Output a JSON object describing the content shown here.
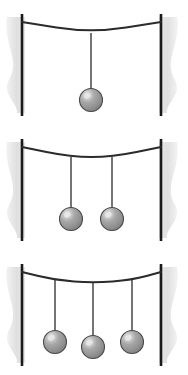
{
  "figure": {
    "width": 188,
    "height": 375,
    "background_color": "#ffffff",
    "panel_count": 3
  },
  "colors": {
    "background": "#ffffff",
    "post": "#1a1a1a",
    "post_shadow": "#dedede",
    "cable": "#2b2b2b",
    "string": "#3a3a3a",
    "ball_fill": "#9a9a9a",
    "ball_fill_dark": "#808080",
    "ball_highlight": "#e8e8e8",
    "ball_outline": "#4a4a4a"
  },
  "geometry": {
    "post_width": 2.6,
    "cable_width": 2.2,
    "string_width": 1.4,
    "ball_radius": 11.5,
    "left_post_x": 22,
    "right_post_x": 161
  },
  "panels": [
    {
      "id": "panel-one-mass",
      "name": "single-mass-panel",
      "mass_count": 1,
      "post_top_y": 14,
      "post_bottom_y": 116,
      "cable_anchor_left": {
        "x": 22,
        "y": 22
      },
      "cable_anchor_right": {
        "x": 161,
        "y": 22
      },
      "cable_vertices": [
        {
          "x": 22,
          "y": 22
        },
        {
          "x": 91,
          "y": 33
        },
        {
          "x": 161,
          "y": 22
        }
      ],
      "shadow_left": {
        "cx": 16,
        "cy": 65,
        "rx": 9,
        "ry": 48
      },
      "shadow_right": {
        "cx": 168,
        "cy": 65,
        "rx": 9,
        "ry": 48
      },
      "masses": [
        {
          "label": "mass-1",
          "anchor_x": 91,
          "anchor_y": 33,
          "ball_cx": 91,
          "ball_cy": 100,
          "string_length": 56
        }
      ]
    },
    {
      "id": "panel-two-masses",
      "name": "double-mass-panel",
      "mass_count": 2,
      "post_top_y": 139,
      "post_bottom_y": 241,
      "cable_anchor_left": {
        "x": 22,
        "y": 147
      },
      "cable_anchor_right": {
        "x": 161,
        "y": 147
      },
      "cable_vertices": [
        {
          "x": 22,
          "y": 147
        },
        {
          "x": 71,
          "y": 157
        },
        {
          "x": 112,
          "y": 157
        },
        {
          "x": 161,
          "y": 147
        }
      ],
      "shadow_left": {
        "cx": 16,
        "cy": 190,
        "rx": 9,
        "ry": 48
      },
      "shadow_right": {
        "cx": 168,
        "cy": 190,
        "rx": 9,
        "ry": 48
      },
      "masses": [
        {
          "label": "mass-1",
          "anchor_x": 71,
          "anchor_y": 157,
          "ball_cx": 71,
          "ball_cy": 219,
          "string_length": 51
        },
        {
          "label": "mass-2",
          "anchor_x": 112,
          "anchor_y": 157,
          "ball_cx": 112,
          "ball_cy": 219,
          "string_length": 51
        }
      ]
    },
    {
      "id": "panel-three-masses",
      "name": "triple-mass-panel",
      "mass_count": 3,
      "post_top_y": 264,
      "post_bottom_y": 366,
      "cable_anchor_left": {
        "x": 22,
        "y": 272
      },
      "cable_anchor_right": {
        "x": 161,
        "y": 272
      },
      "cable_vertices": [
        {
          "x": 22,
          "y": 272
        },
        {
          "x": 55,
          "y": 280
        },
        {
          "x": 93,
          "y": 283
        },
        {
          "x": 132,
          "y": 280
        },
        {
          "x": 161,
          "y": 272
        }
      ],
      "shadow_left": {
        "cx": 16,
        "cy": 315,
        "rx": 9,
        "ry": 48
      },
      "shadow_right": {
        "cx": 168,
        "cy": 315,
        "rx": 9,
        "ry": 48
      },
      "masses": [
        {
          "label": "mass-1",
          "anchor_x": 55,
          "anchor_y": 280,
          "ball_cx": 55,
          "ball_cy": 342,
          "string_length": 51
        },
        {
          "label": "mass-2",
          "anchor_x": 93,
          "anchor_y": 283,
          "ball_cx": 93,
          "ball_cy": 347,
          "string_length": 53
        },
        {
          "label": "mass-3",
          "anchor_x": 132,
          "anchor_y": 280,
          "ball_cx": 132,
          "ball_cy": 342,
          "string_length": 51
        }
      ]
    }
  ]
}
